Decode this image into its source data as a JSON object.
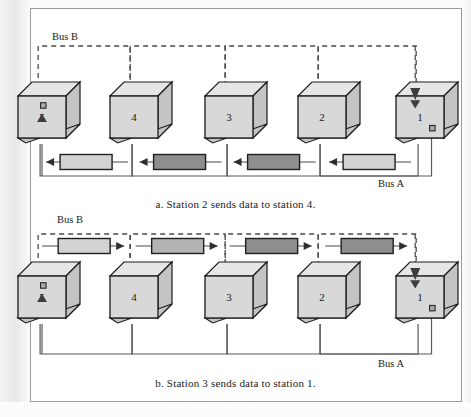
{
  "figure": {
    "type": "dual-bus-network-diagram",
    "panels": [
      {
        "id": "a",
        "caption": "a. Station 2 sends data to station 4.",
        "bus_b_label": "Bus B",
        "bus_a_label": "Bus A",
        "bus_b_style": "dashed",
        "bus_a_style": "solid",
        "packet_row": "bus-a",
        "packet_direction": "left",
        "stations": [
          {
            "number": "5",
            "role": "receiver",
            "arrow": "up",
            "tap": "top"
          },
          {
            "number": "4",
            "role": "relay",
            "arrow": "none",
            "tap": "none"
          },
          {
            "number": "3",
            "role": "relay",
            "arrow": "none",
            "tap": "none"
          },
          {
            "number": "2",
            "role": "relay",
            "arrow": "none",
            "tap": "none"
          },
          {
            "number": "1",
            "role": "source-end",
            "arrow": "down",
            "tap": "bottom"
          }
        ],
        "packets": [
          {
            "shade": "light"
          },
          {
            "shade": "dark"
          },
          {
            "shade": "dark"
          },
          {
            "shade": "light"
          }
        ]
      },
      {
        "id": "b",
        "caption": "b. Station 3 sends data to station 1.",
        "bus_b_label": "Bus B",
        "bus_a_label": "Bus A",
        "bus_b_style": "dashed",
        "bus_a_style": "solid",
        "packet_row": "bus-b",
        "packet_direction": "right",
        "stations": [
          {
            "number": "5",
            "role": "receiver",
            "arrow": "up",
            "tap": "top"
          },
          {
            "number": "4",
            "role": "relay",
            "arrow": "none",
            "tap": "none"
          },
          {
            "number": "3",
            "role": "relay",
            "arrow": "none",
            "tap": "none"
          },
          {
            "number": "2",
            "role": "relay",
            "arrow": "none",
            "tap": "none"
          },
          {
            "number": "1",
            "role": "destination",
            "arrow": "down",
            "tap": "bottom"
          }
        ],
        "packets": [
          {
            "shade": "light"
          },
          {
            "shade": "medium"
          },
          {
            "shade": "dark"
          },
          {
            "shade": "dark"
          }
        ]
      }
    ],
    "colors": {
      "packet_light": "#d2d2d2",
      "packet_medium": "#b4b4b4",
      "packet_dark": "#8e8e8e",
      "station_front": "#d8d8d8",
      "station_side": "#c4c4c4",
      "station_top": "#e6e6e6",
      "line": "#5a5a5a",
      "outline": "#1a1a1a",
      "frame": "#9a9a9a"
    }
  }
}
